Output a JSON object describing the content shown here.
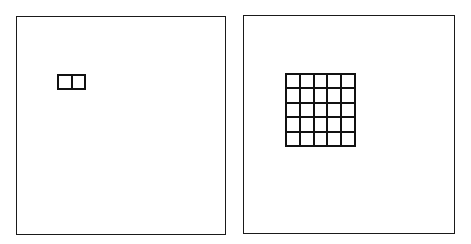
{
  "diagram": {
    "panels": [
      {
        "id": "left",
        "box": {
          "x": 16,
          "y": 16,
          "w": 210,
          "h": 219
        },
        "grid": {
          "rows": 1,
          "cols": 2,
          "x": 57,
          "y": 74,
          "w": 29,
          "h": 16
        }
      },
      {
        "id": "right",
        "box": {
          "x": 243,
          "y": 15,
          "w": 212,
          "h": 219
        },
        "grid": {
          "rows": 5,
          "cols": 5,
          "x": 285,
          "y": 73,
          "w": 71,
          "h": 74
        }
      }
    ],
    "colors": {
      "stroke": "#111111",
      "background": "#ffffff"
    }
  }
}
